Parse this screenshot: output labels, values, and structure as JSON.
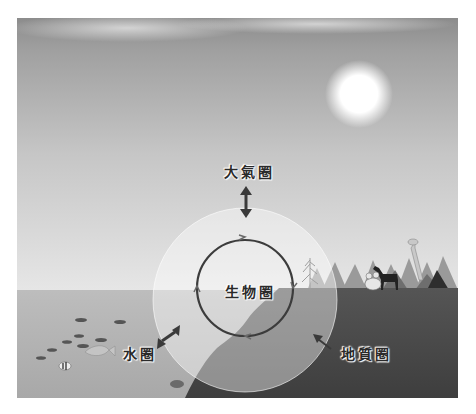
{
  "diagram": {
    "title": "",
    "labels": {
      "atmosphere": "大氣圈",
      "biosphere": "生物圈",
      "hydrosphere": "水圈",
      "geosphere": "地質圈"
    },
    "elements": {
      "sun": "sun",
      "sky": "gradient-sky",
      "ocean": "ocean-with-fish",
      "land": "land-cliff-with-forest",
      "animals": [
        "horse",
        "giraffe",
        "frog"
      ],
      "outer_circle": "spheres-interaction-zone",
      "inner_cycle": "circular-arrow-cycle"
    },
    "colors": {
      "sky_top": "#8f8f8f",
      "sky_bottom": "#e8e8e8",
      "water": "#b8b8b8",
      "land": "#4a4a4a",
      "circle_fill": "rgba(255,255,255,0.45)",
      "cycle_stroke": "#3c3c3c",
      "arrow": "#3a3a3a"
    }
  }
}
